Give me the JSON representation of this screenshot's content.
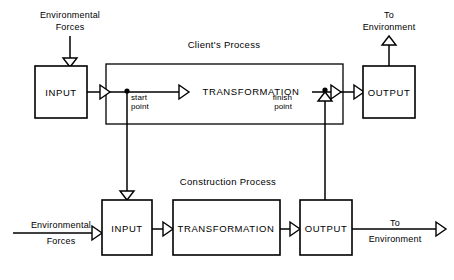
{
  "diagram": {
    "canvas": {
      "width": 454,
      "height": 280,
      "background": "#ffffff"
    },
    "ink_color": "#000000",
    "groups": {
      "clients_process": {
        "label": "Client's Process"
      },
      "construction_process": {
        "label": "Construction Process"
      }
    },
    "boxes": {
      "client_input": {
        "label": "INPUT"
      },
      "client_transformation": {
        "label": "TRANSFORMATION"
      },
      "client_output": {
        "label": "OUTPUT"
      },
      "construction_input": {
        "label": "INPUT"
      },
      "construction_transformation": {
        "label": "TRANSFORMATION"
      },
      "construction_output": {
        "label": "OUTPUT"
      }
    },
    "annotations": {
      "start_point_line1": "start",
      "start_point_line2": "point",
      "finish_point_line1": "finish",
      "finish_point_line2": "point"
    },
    "external_labels": {
      "top_env_forces_line1": "Environmental",
      "top_env_forces_line2": "Forces",
      "top_to_environment_line1": "To",
      "top_to_environment_line2": "Environment",
      "bottom_env_forces_line1": "Environmental",
      "bottom_env_forces_line2": "Forces",
      "bottom_to_environment_line1": "To",
      "bottom_to_environment_line2": "Environment"
    }
  }
}
